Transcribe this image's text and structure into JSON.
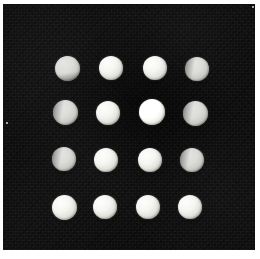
{
  "image": {
    "title": "Grid of sixteen pale discs on black fabric",
    "width": 260,
    "height": 259,
    "border_color": "#ffffff",
    "background_color": "#0d0d0d",
    "disc_color": "#e8e8e2",
    "grid_rows": 4,
    "grid_columns": 4,
    "disc_count": 16
  },
  "field": {
    "left": 3,
    "top": 4,
    "width": 252,
    "height": 246,
    "label": "dark fabric background"
  },
  "discs": [
    {
      "id": "r1c1",
      "row": 1,
      "col": 1,
      "cx": 67,
      "cy": 68,
      "d": 25,
      "tone": "tone-dim",
      "lobe": "lobe-bottom"
    },
    {
      "id": "r1c2",
      "row": 1,
      "col": 2,
      "cx": 111,
      "cy": 68,
      "d": 24,
      "tone": "tone-normal",
      "lobe": ""
    },
    {
      "id": "r1c3",
      "row": 1,
      "col": 3,
      "cx": 155,
      "cy": 68,
      "d": 24,
      "tone": "tone-normal",
      "lobe": ""
    },
    {
      "id": "r1c4",
      "row": 1,
      "col": 4,
      "cx": 197,
      "cy": 69,
      "d": 24,
      "tone": "tone-dim",
      "lobe": "lobe-left"
    },
    {
      "id": "r2c1",
      "row": 2,
      "col": 1,
      "cx": 65,
      "cy": 112,
      "d": 25,
      "tone": "tone-dim",
      "lobe": "lobe-left"
    },
    {
      "id": "r2c2",
      "row": 2,
      "col": 2,
      "cx": 108,
      "cy": 113,
      "d": 24,
      "tone": "tone-normal",
      "lobe": ""
    },
    {
      "id": "r2c3",
      "row": 2,
      "col": 3,
      "cx": 152,
      "cy": 112,
      "d": 26,
      "tone": "tone-bright",
      "lobe": ""
    },
    {
      "id": "r2c4",
      "row": 2,
      "col": 4,
      "cx": 195,
      "cy": 113,
      "d": 25,
      "tone": "tone-dim",
      "lobe": "lobe-left"
    },
    {
      "id": "r3c1",
      "row": 3,
      "col": 1,
      "cx": 64,
      "cy": 159,
      "d": 24,
      "tone": "tone-dim",
      "lobe": "lobe-left"
    },
    {
      "id": "r3c2",
      "row": 3,
      "col": 2,
      "cx": 106,
      "cy": 160,
      "d": 24,
      "tone": "tone-normal",
      "lobe": ""
    },
    {
      "id": "r3c3",
      "row": 3,
      "col": 3,
      "cx": 150,
      "cy": 160,
      "d": 24,
      "tone": "tone-normal",
      "lobe": ""
    },
    {
      "id": "r3c4",
      "row": 3,
      "col": 4,
      "cx": 192,
      "cy": 160,
      "d": 24,
      "tone": "tone-dim",
      "lobe": "lobe-left"
    },
    {
      "id": "r4c1",
      "row": 4,
      "col": 1,
      "cx": 64,
      "cy": 207,
      "d": 25,
      "tone": "tone-normal",
      "lobe": ""
    },
    {
      "id": "r4c2",
      "row": 4,
      "col": 2,
      "cx": 105,
      "cy": 207,
      "d": 24,
      "tone": "tone-normal",
      "lobe": ""
    },
    {
      "id": "r4c3",
      "row": 4,
      "col": 3,
      "cx": 148,
      "cy": 207,
      "d": 24,
      "tone": "tone-normal",
      "lobe": ""
    },
    {
      "id": "r4c4",
      "row": 4,
      "col": 4,
      "cx": 190,
      "cy": 207,
      "d": 24,
      "tone": "tone-normal",
      "lobe": ""
    }
  ],
  "specks": [
    {
      "x": 6,
      "y": 122,
      "size": 2
    },
    {
      "x": 252,
      "y": 6,
      "size": 2
    }
  ]
}
